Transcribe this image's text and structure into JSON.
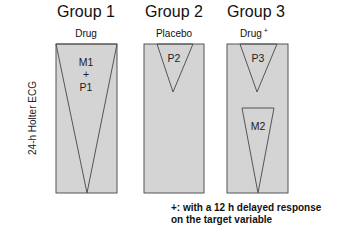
{
  "diagram": {
    "y_axis_label": "24-h Holter ECG",
    "groups": [
      {
        "title": "Group 1",
        "treatment": "Drug",
        "labels": [
          "M1",
          "+",
          "P1"
        ]
      },
      {
        "title": "Group 2",
        "treatment": "Placebo",
        "labels": [
          "P2"
        ]
      },
      {
        "title": "Group 3",
        "treatment": "Drug",
        "treatment_superscript": "+",
        "labels": [
          "P3",
          "M2"
        ]
      }
    ],
    "footnote": [
      "+: with a 12 h delayed response",
      "on the target variable"
    ],
    "colors": {
      "box_fill": "#d4d4d4",
      "stroke": "#555555",
      "text": "#111111"
    }
  }
}
